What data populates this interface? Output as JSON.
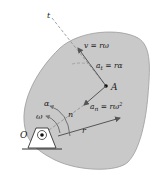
{
  "diagram": {
    "labels": {
      "tangent_axis": "t",
      "velocity": "v = rω",
      "tangential_accel_main": "a",
      "tangential_accel_sub": "t",
      "tangential_accel_rhs": " = rα",
      "point": "A",
      "normal_accel_main": "a",
      "normal_accel_sub": "n",
      "normal_accel_rhs": " = rω",
      "normal_accel_exp": "2",
      "normal_axis": "n",
      "radius": "r",
      "angular_accel": "α",
      "angular_velocity": "ω",
      "pivot": "O"
    },
    "colors": {
      "body_fill": "#c9c9c9",
      "body_stroke": "#9a9a9a",
      "vector": "#555555",
      "dashed": "#8a8a8a",
      "text": "#1a1a1a",
      "support": "#ffffff"
    }
  }
}
